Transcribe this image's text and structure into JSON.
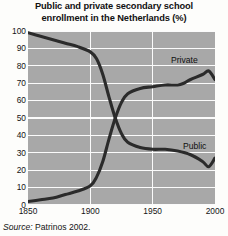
{
  "chart_data": {
    "type": "line",
    "title": "Public and private secondary school enrollment in the Netherlands (%)",
    "title_lines": [
      "Public and private secondary school",
      "enrollment in the Netherlands (%)"
    ],
    "xlabel": "",
    "ylabel": "",
    "xlim": [
      1850,
      2000
    ],
    "ylim": [
      0,
      100
    ],
    "xticks": [
      1850,
      1900,
      1950,
      2000
    ],
    "xtick_labels": [
      "1850",
      "1900",
      "1950",
      "2000"
    ],
    "yticks": [
      0,
      10,
      20,
      30,
      40,
      50,
      60,
      70,
      80,
      90,
      100
    ],
    "ytick_labels": [
      "0",
      "10",
      "20",
      "30",
      "40",
      "50",
      "60",
      "70",
      "80",
      "90",
      "100"
    ],
    "grid": "horizontal-and-vertical",
    "grid_color": "#fbfbfb",
    "plot_background": "#a8a8a8",
    "legend_position": "inline-annotations",
    "series": [
      {
        "name": "Public",
        "label": "Public",
        "color": "#2b2b2b",
        "x": [
          1850,
          1860,
          1870,
          1880,
          1890,
          1900,
          1905,
          1910,
          1915,
          1920,
          1925,
          1930,
          1940,
          1950,
          1960,
          1970,
          1980,
          1990,
          1995,
          2000
        ],
        "values": [
          99,
          97,
          95,
          93,
          91,
          88,
          84,
          75,
          62,
          50,
          41,
          36,
          33,
          32,
          32,
          31,
          29,
          25,
          22,
          27
        ]
      },
      {
        "name": "Private",
        "label": "Private",
        "color": "#2b2b2b",
        "x": [
          1850,
          1860,
          1870,
          1880,
          1890,
          1900,
          1905,
          1910,
          1915,
          1920,
          1925,
          1930,
          1940,
          1950,
          1960,
          1970,
          1975,
          1980,
          1990,
          1995,
          2000
        ],
        "values": [
          2,
          3,
          4,
          6,
          8,
          11,
          16,
          25,
          38,
          50,
          59,
          64,
          67,
          68,
          69,
          69,
          70,
          72,
          75,
          77,
          72
        ]
      }
    ],
    "annotations": [
      {
        "name": "private-series-label",
        "text": "Private"
      },
      {
        "name": "public-series-label",
        "text": "Public"
      }
    ]
  },
  "source": {
    "lead": "Source:",
    "text": "Patrinos 2002."
  }
}
